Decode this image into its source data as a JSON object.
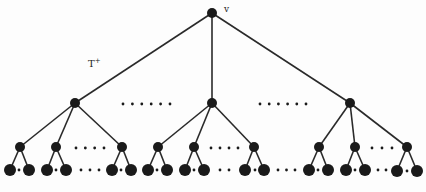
{
  "diagram": {
    "type": "tree",
    "root_label": "v",
    "tree_label": "T",
    "tree_label_superscript": "+",
    "colors": {
      "node": "#1a1a1a",
      "edge": "#2a2a2a",
      "background": "#fdfdfd"
    },
    "nodes": [
      {
        "id": "v",
        "x": 212,
        "y": 13,
        "r": 5
      },
      {
        "id": "a",
        "x": 75,
        "y": 103,
        "r": 5
      },
      {
        "id": "b",
        "x": 212,
        "y": 103,
        "r": 5
      },
      {
        "id": "c",
        "x": 350,
        "y": 103,
        "r": 5
      },
      {
        "id": "a1",
        "x": 20,
        "y": 147,
        "r": 5
      },
      {
        "id": "a2",
        "x": 56,
        "y": 147,
        "r": 5
      },
      {
        "id": "a3",
        "x": 122,
        "y": 147,
        "r": 5
      },
      {
        "id": "b1",
        "x": 158,
        "y": 147,
        "r": 5
      },
      {
        "id": "b2",
        "x": 194,
        "y": 147,
        "r": 5
      },
      {
        "id": "b3",
        "x": 254,
        "y": 147,
        "r": 5
      },
      {
        "id": "c1",
        "x": 319,
        "y": 147,
        "r": 5
      },
      {
        "id": "c2",
        "x": 355,
        "y": 147,
        "r": 5
      },
      {
        "id": "c3",
        "x": 407,
        "y": 147,
        "r": 5
      },
      {
        "id": "a1l",
        "x": 10,
        "y": 170,
        "r": 6
      },
      {
        "id": "a1r",
        "x": 29,
        "y": 170,
        "r": 6
      },
      {
        "id": "a2l",
        "x": 47,
        "y": 170,
        "r": 6
      },
      {
        "id": "a2r",
        "x": 66,
        "y": 170,
        "r": 6
      },
      {
        "id": "a3l",
        "x": 112,
        "y": 170,
        "r": 6
      },
      {
        "id": "a3r",
        "x": 131,
        "y": 170,
        "r": 6
      },
      {
        "id": "b1l",
        "x": 148,
        "y": 170,
        "r": 6
      },
      {
        "id": "b1r",
        "x": 167,
        "y": 170,
        "r": 6
      },
      {
        "id": "b2l",
        "x": 185,
        "y": 170,
        "r": 6
      },
      {
        "id": "b2r",
        "x": 204,
        "y": 170,
        "r": 6
      },
      {
        "id": "b3l",
        "x": 245,
        "y": 170,
        "r": 6
      },
      {
        "id": "b3r",
        "x": 264,
        "y": 170,
        "r": 6
      },
      {
        "id": "c1l",
        "x": 309,
        "y": 170,
        "r": 6
      },
      {
        "id": "c1r",
        "x": 328,
        "y": 170,
        "r": 6
      },
      {
        "id": "c2l",
        "x": 346,
        "y": 170,
        "r": 6
      },
      {
        "id": "c2r",
        "x": 365,
        "y": 170,
        "r": 6
      },
      {
        "id": "c3l",
        "x": 397,
        "y": 171,
        "r": 6
      },
      {
        "id": "c3r",
        "x": 417,
        "y": 171,
        "r": 6
      }
    ],
    "edges": [
      [
        "v",
        "a"
      ],
      [
        "v",
        "b"
      ],
      [
        "v",
        "c"
      ],
      [
        "a",
        "a1"
      ],
      [
        "a",
        "a2"
      ],
      [
        "a",
        "a3"
      ],
      [
        "b",
        "b1"
      ],
      [
        "b",
        "b2"
      ],
      [
        "b",
        "b3"
      ],
      [
        "c",
        "c1"
      ],
      [
        "c",
        "c2"
      ],
      [
        "c",
        "c3"
      ],
      [
        "a1",
        "a1l"
      ],
      [
        "a1",
        "a1r"
      ],
      [
        "a2",
        "a2l"
      ],
      [
        "a2",
        "a2r"
      ],
      [
        "a3",
        "a3l"
      ],
      [
        "a3",
        "a3r"
      ],
      [
        "b1",
        "b1l"
      ],
      [
        "b1",
        "b1r"
      ],
      [
        "b2",
        "b2l"
      ],
      [
        "b2",
        "b2r"
      ],
      [
        "b3",
        "b3l"
      ],
      [
        "b3",
        "b3r"
      ],
      [
        "c1",
        "c1l"
      ],
      [
        "c1",
        "c1r"
      ],
      [
        "c2",
        "c2l"
      ],
      [
        "c2",
        "c2r"
      ],
      [
        "c3",
        "c3l"
      ],
      [
        "c3",
        "c3r"
      ]
    ],
    "ellipses": [
      {
        "x0": 123,
        "x1": 170,
        "y": 104,
        "count": 6
      },
      {
        "x0": 260,
        "x1": 306,
        "y": 104,
        "count": 6
      },
      {
        "x0": 76,
        "x1": 104,
        "y": 148,
        "count": 4
      },
      {
        "x0": 211,
        "x1": 238,
        "y": 148,
        "count": 4
      },
      {
        "x0": 372,
        "x1": 392,
        "y": 148,
        "count": 3
      },
      {
        "x0": 19,
        "x1": 19,
        "y": 170,
        "count": 1
      },
      {
        "x0": 56,
        "x1": 56,
        "y": 170,
        "count": 1
      },
      {
        "x0": 121,
        "x1": 121,
        "y": 170,
        "count": 1
      },
      {
        "x0": 157,
        "x1": 157,
        "y": 170,
        "count": 1
      },
      {
        "x0": 194,
        "x1": 194,
        "y": 170,
        "count": 1
      },
      {
        "x0": 255,
        "x1": 255,
        "y": 170,
        "count": 1
      },
      {
        "x0": 318,
        "x1": 318,
        "y": 170,
        "count": 1
      },
      {
        "x0": 355,
        "x1": 355,
        "y": 170,
        "count": 1
      },
      {
        "x0": 407,
        "x1": 407,
        "y": 171,
        "count": 1
      },
      {
        "x0": 81,
        "x1": 99,
        "y": 170,
        "count": 3
      },
      {
        "x0": 220,
        "x1": 229,
        "y": 170,
        "count": 2
      },
      {
        "x0": 278,
        "x1": 295,
        "y": 170,
        "count": 3
      },
      {
        "x0": 378,
        "x1": 386,
        "y": 170,
        "count": 2
      }
    ]
  }
}
